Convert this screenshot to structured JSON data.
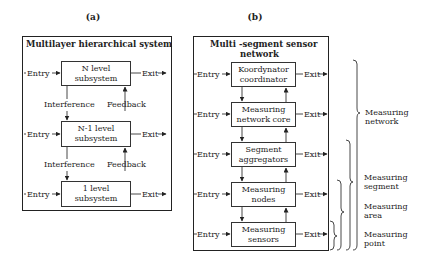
{
  "panel_a": {
    "label": "(a)",
    "title": "Multilayer hierarchical system",
    "levels": [
      {
        "line1": "N level",
        "line2": "subsystem",
        "entry": "Entry",
        "exit": "Exit"
      },
      {
        "line1": "N-1 level",
        "line2": "subsystem",
        "entry": "Entry",
        "exit": "Exit"
      },
      {
        "line1": "1 level",
        "line2": "subsystem",
        "entry": "Entry",
        "exit": "Exit"
      }
    ],
    "connectors": [
      {
        "down": "Interference",
        "up": "Feedback"
      },
      {
        "down": "Interference",
        "up": "Feedback"
      }
    ]
  },
  "panel_b": {
    "label": "(b)",
    "title_line1": "Multi -segment sensor",
    "title_line2": "network",
    "levels": [
      {
        "line1": "Koordynator",
        "line2": "coordinator",
        "entry": "Entry",
        "exit": "Exit"
      },
      {
        "line1": "Measuring",
        "line2": "network core",
        "entry": "Entry",
        "exit": "Exit"
      },
      {
        "line1": "Segment",
        "line2": "aggregators",
        "entry": "Entry",
        "exit": "Exit"
      },
      {
        "line1": "Measuring",
        "line2": "nodes",
        "entry": "Entry",
        "exit": "Exit"
      },
      {
        "line1": "Measuring",
        "line2": "sensors",
        "entry": "Entry",
        "exit": "Exit"
      }
    ],
    "braces": [
      {
        "line1": "Measuring",
        "line2": "network"
      },
      {
        "line1": "Measuring",
        "line2": "segment"
      },
      {
        "line1": "Measuring",
        "line2": "area"
      },
      {
        "line1": "Measuring",
        "line2": "point"
      }
    ]
  }
}
